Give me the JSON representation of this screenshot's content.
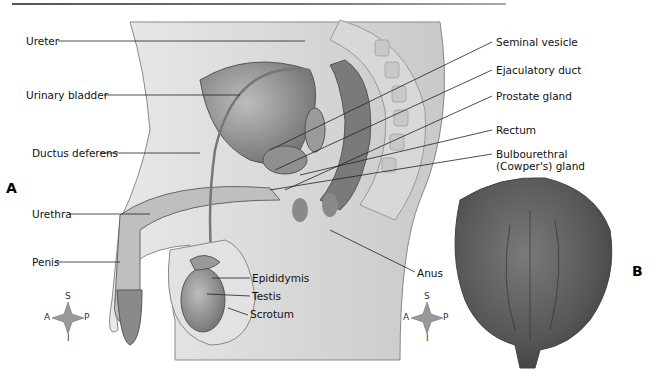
{
  "figure": {
    "panels": [
      {
        "id": "A",
        "label": "A"
      },
      {
        "id": "B",
        "label": "B"
      }
    ],
    "labels_left": [
      {
        "text": "Ureter"
      },
      {
        "text": "Urinary bladder"
      },
      {
        "text": "Ductus deferens"
      },
      {
        "text": "Urethra"
      },
      {
        "text": "Penis"
      }
    ],
    "labels_right": [
      {
        "text": "Seminal vesicle"
      },
      {
        "text": "Ejaculatory duct"
      },
      {
        "text": "Prostate gland"
      },
      {
        "text": "Rectum"
      },
      {
        "text": "Bulbourethral"
      },
      {
        "text": "(Cowper's) gland"
      }
    ],
    "labels_bottom": [
      {
        "text": "Epididymis"
      },
      {
        "text": "Testis"
      },
      {
        "text": "Scrotum"
      },
      {
        "text": "Anus"
      }
    ],
    "compass": {
      "superior": "S",
      "inferior": "I",
      "anterior": "A",
      "posterior": "P"
    }
  }
}
